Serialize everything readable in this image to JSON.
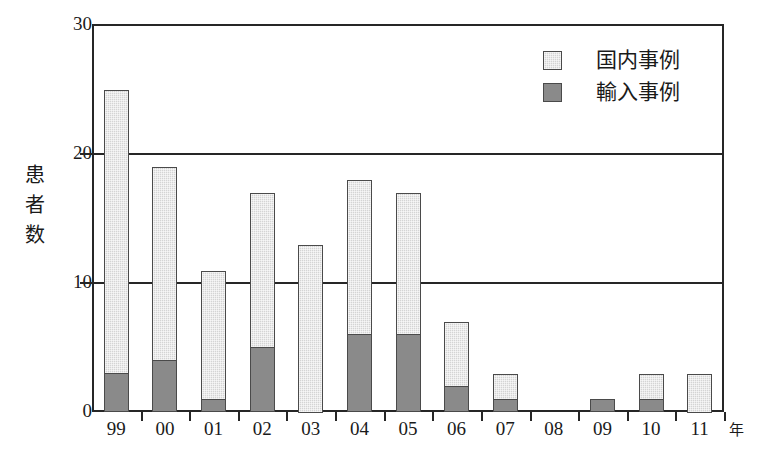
{
  "chart_data": {
    "type": "bar",
    "subtype": "stacked-bar",
    "title": "",
    "xlabel": "年",
    "ylabel": "患者数",
    "ylim": [
      0,
      30
    ],
    "yticks": [
      0,
      10,
      20,
      30
    ],
    "grid": true,
    "gridlines_at": [
      10,
      20
    ],
    "legend_position": "top-right",
    "categories": [
      "99",
      "00",
      "01",
      "02",
      "03",
      "04",
      "05",
      "06",
      "07",
      "08",
      "09",
      "10",
      "11"
    ],
    "series": [
      {
        "name": "輸入事例",
        "color": "#8a8a8a",
        "values": [
          3,
          4,
          1,
          5,
          0,
          6,
          6,
          2,
          1,
          0,
          1,
          1,
          0
        ]
      },
      {
        "name": "国内事例",
        "color": "#d4d4d4",
        "values": [
          22,
          15,
          10,
          12,
          13,
          12,
          11,
          5,
          2,
          0,
          0,
          2,
          3
        ]
      }
    ],
    "totals": [
      25,
      19,
      11,
      17,
      13,
      18,
      17,
      7,
      3,
      0,
      1,
      3,
      3
    ]
  },
  "axes": {
    "y_title_chars": [
      "患",
      "者",
      "数"
    ],
    "y_tick_labels": [
      "30",
      "20",
      "10",
      "0"
    ],
    "x_tick_labels": [
      "99",
      "00",
      "01",
      "02",
      "03",
      "04",
      "05",
      "06",
      "07",
      "08",
      "09",
      "10",
      "11"
    ],
    "x_unit_label": "年"
  },
  "legend": {
    "items": [
      {
        "label": "国内事例",
        "swatch": "#d4d4d4",
        "style": "light-hatched"
      },
      {
        "label": "輸入事例",
        "swatch": "#8a8a8a",
        "style": "dark-solid"
      }
    ]
  },
  "colors": {
    "domestic": "#d4d4d4",
    "imported": "#8a8a8a",
    "axis": "#262626",
    "bar_outline": "#4a4a4a",
    "background": "#ffffff",
    "text": "#1a1a1a"
  }
}
